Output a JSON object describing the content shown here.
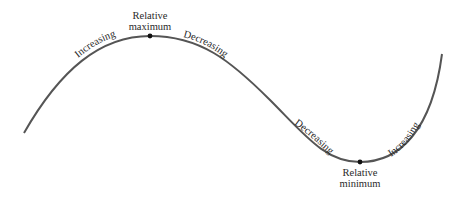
{
  "diagram": {
    "type": "function-curve-extrema",
    "curve_color": "#555555",
    "dot_color": "#111111",
    "segments": [
      {
        "label": "Increasing"
      },
      {
        "label": "Decreasing"
      },
      {
        "label": "Decreasing"
      },
      {
        "label": "Increasing"
      }
    ],
    "maximum": {
      "line1": "Relative",
      "line2": "maximum"
    },
    "minimum": {
      "line1": "Relative",
      "line2": "minimum"
    }
  }
}
